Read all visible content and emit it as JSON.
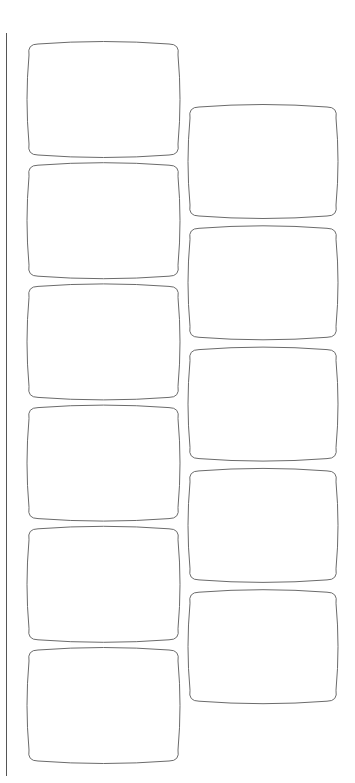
{
  "page": {
    "background_color": "#ffffff",
    "stroke_color": "#6b6b6b",
    "divider_color": "#555555"
  },
  "columns": [
    {
      "name": "left",
      "tile_count": 6,
      "tiles": [
        {
          "index": 1
        },
        {
          "index": 2
        },
        {
          "index": 3
        },
        {
          "index": 4
        },
        {
          "index": 5
        },
        {
          "index": 6
        }
      ]
    },
    {
      "name": "right",
      "tile_count": 5,
      "tiles": [
        {
          "index": 1
        },
        {
          "index": 2
        },
        {
          "index": 3
        },
        {
          "index": 4
        },
        {
          "index": 5
        }
      ]
    }
  ]
}
